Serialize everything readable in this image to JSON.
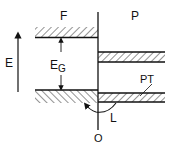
{
  "diagram": {
    "labels": {
      "left_region": "F",
      "right_region": "P",
      "energy_axis": "E",
      "gap": "E",
      "gap_sub": "G",
      "interface_level": "PT",
      "transition": "L",
      "origin": "O"
    },
    "colors": {
      "ink": "#111111",
      "background": "#ffffff"
    }
  }
}
